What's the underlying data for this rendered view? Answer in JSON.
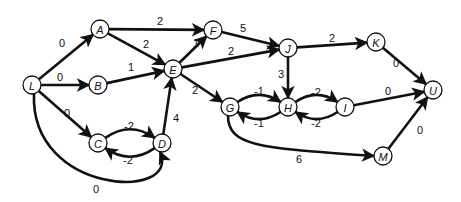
{
  "diagram": {
    "type": "directed-weighted-graph",
    "nodes": [
      {
        "id": "L",
        "label": "L",
        "x": 32,
        "y": 85
      },
      {
        "id": "A",
        "label": "A",
        "x": 100,
        "y": 29
      },
      {
        "id": "B",
        "label": "B",
        "x": 98,
        "y": 85
      },
      {
        "id": "C",
        "label": "C",
        "x": 98,
        "y": 143
      },
      {
        "id": "D",
        "label": "D",
        "x": 162,
        "y": 143
      },
      {
        "id": "E",
        "label": "E",
        "x": 173,
        "y": 69
      },
      {
        "id": "F",
        "label": "F",
        "x": 213,
        "y": 30
      },
      {
        "id": "J",
        "label": "J",
        "x": 288,
        "y": 48
      },
      {
        "id": "K",
        "label": "K",
        "x": 376,
        "y": 42
      },
      {
        "id": "U",
        "label": "U",
        "x": 433,
        "y": 90
      },
      {
        "id": "G",
        "label": "G",
        "x": 230,
        "y": 107
      },
      {
        "id": "H",
        "label": "H",
        "x": 288,
        "y": 107
      },
      {
        "id": "I",
        "label": "I",
        "x": 345,
        "y": 107
      },
      {
        "id": "M",
        "label": "M",
        "x": 383,
        "y": 156
      }
    ],
    "edges": [
      {
        "from": "L",
        "to": "A",
        "weight": "0",
        "lx": 62,
        "ly": 43,
        "curve": 0
      },
      {
        "from": "L",
        "to": "B",
        "weight": "0",
        "lx": 60,
        "ly": 77,
        "curve": 0
      },
      {
        "from": "L",
        "to": "C",
        "weight": "0",
        "lx": 67,
        "ly": 113,
        "curve": 0
      },
      {
        "from": "L",
        "to": "D",
        "weight": "0",
        "lx": 96,
        "ly": 189,
        "curve": "LD"
      },
      {
        "from": "A",
        "to": "F",
        "weight": "2",
        "lx": 160,
        "ly": 21,
        "curve": 0
      },
      {
        "from": "A",
        "to": "E",
        "weight": "2",
        "lx": 146,
        "ly": 44,
        "curve": 0
      },
      {
        "from": "B",
        "to": "E",
        "weight": "1",
        "lx": 131,
        "ly": 67,
        "curve": 0
      },
      {
        "from": "C",
        "to": "D",
        "weight": "-2",
        "lx": 129,
        "ly": 126,
        "curve": -14
      },
      {
        "from": "D",
        "to": "C",
        "weight": "-2",
        "lx": 128,
        "ly": 160,
        "curve": -14
      },
      {
        "from": "D",
        "to": "E",
        "weight": "4",
        "lx": 176,
        "ly": 118,
        "curve": 0
      },
      {
        "from": "E",
        "to": "F",
        "weight": "1",
        "lx": 196,
        "ly": 43,
        "curve": 0
      },
      {
        "from": "E",
        "to": "J",
        "weight": "2",
        "lx": 231,
        "ly": 51,
        "curve": 0
      },
      {
        "from": "E",
        "to": "G",
        "weight": "2",
        "lx": 195,
        "ly": 90,
        "curve": 0
      },
      {
        "from": "F",
        "to": "J",
        "weight": "5",
        "lx": 243,
        "ly": 28,
        "curve": 0
      },
      {
        "from": "J",
        "to": "K",
        "weight": "2",
        "lx": 332,
        "ly": 38,
        "curve": 0
      },
      {
        "from": "J",
        "to": "H",
        "weight": "3",
        "lx": 281,
        "ly": 74,
        "curve": 0
      },
      {
        "from": "K",
        "to": "U",
        "weight": "0",
        "lx": 396,
        "ly": 63,
        "curve": 0
      },
      {
        "from": "G",
        "to": "H",
        "weight": "-1",
        "lx": 259,
        "ly": 91,
        "curve": -12
      },
      {
        "from": "H",
        "to": "G",
        "weight": "-1",
        "lx": 259,
        "ly": 123,
        "curve": -12
      },
      {
        "from": "H",
        "to": "I",
        "weight": "-2",
        "lx": 316,
        "ly": 92,
        "curve": -12
      },
      {
        "from": "I",
        "to": "H",
        "weight": "-2",
        "lx": 316,
        "ly": 123,
        "curve": -12
      },
      {
        "from": "I",
        "to": "U",
        "weight": "0",
        "lx": 388,
        "ly": 91,
        "curve": 0
      },
      {
        "from": "G",
        "to": "M",
        "weight": "6",
        "lx": 299,
        "ly": 159,
        "curve": "GM"
      },
      {
        "from": "M",
        "to": "U",
        "weight": "0",
        "lx": 420,
        "ly": 130,
        "curve": 0
      }
    ]
  }
}
